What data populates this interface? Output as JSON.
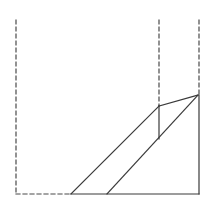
{
  "diagram": {
    "type": "geometric-line-drawing",
    "width": 215,
    "height": 209,
    "colors": {
      "background": "#ffffff",
      "stroke": "#3a3a3a",
      "dashed_stroke": "#4a4a4a"
    },
    "dashed_lines": [
      {
        "name": "left-vertical-guide",
        "x1": 16,
        "y1": 20,
        "x2": 16,
        "y2": 194
      },
      {
        "name": "bottom-left-guide",
        "x1": 16,
        "y1": 194,
        "x2": 71,
        "y2": 194
      },
      {
        "name": "middle-vertical-guide",
        "x1": 159,
        "y1": 20,
        "x2": 159,
        "y2": 106
      },
      {
        "name": "right-vertical-guide",
        "x1": 199,
        "y1": 20,
        "x2": 199,
        "y2": 95
      }
    ],
    "solid_lines": [
      {
        "name": "base-line",
        "x1": 71,
        "y1": 194,
        "x2": 199,
        "y2": 194
      },
      {
        "name": "right-edge",
        "x1": 199,
        "y1": 95,
        "x2": 199,
        "y2": 194
      },
      {
        "name": "left-diagonal",
        "x1": 71,
        "y1": 194,
        "x2": 159,
        "y2": 106
      },
      {
        "name": "right-diagonal",
        "x1": 107,
        "y1": 194,
        "x2": 198,
        "y2": 95
      },
      {
        "name": "top-edge",
        "x1": 159,
        "y1": 106,
        "x2": 198,
        "y2": 95
      },
      {
        "name": "inner-vertical",
        "x1": 159,
        "y1": 106,
        "x2": 159,
        "y2": 139
      }
    ]
  }
}
